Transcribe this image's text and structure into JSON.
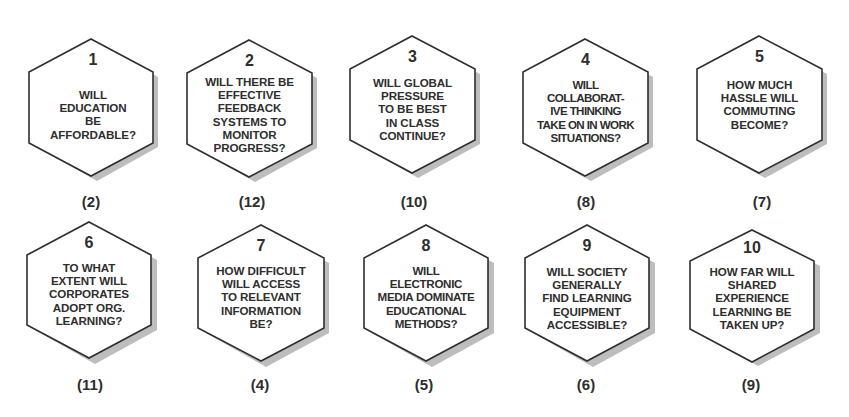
{
  "diagram": {
    "type": "hexagon-question-grid",
    "rows": 2,
    "columns": 5,
    "colors": {
      "outline": "#2e2e2e",
      "fill": "#ffffff",
      "shadow": "#bdbdbd",
      "text": "#2e2e2e"
    },
    "items": [
      {
        "number": "1",
        "question": "WILL\nEDUCATION\nBE\nAFFORDABLE?",
        "rank": "(2)"
      },
      {
        "number": "2",
        "question": "WILL THERE BE\nEFFECTIVE\nFEEDBACK\nSYSTEMS TO\nMONITOR\nPROGRESS?",
        "rank": "(12)"
      },
      {
        "number": "3",
        "question": "WILL GLOBAL\nPRESSURE\nTO BE BEST\nIN CLASS\nCONTINUE?",
        "rank": "(10)"
      },
      {
        "number": "4",
        "question": "WILL\nCOLLABORAT-\nIVE THINKING\nTAKE ON IN WORK\nSITUATIONS?",
        "rank": "(8)"
      },
      {
        "number": "5",
        "question": "HOW MUCH\nHASSLE WILL\nCOMMUTING\nBECOME?",
        "rank": "(7)"
      },
      {
        "number": "6",
        "question": "TO WHAT\nEXTENT WILL\nCORPORATES\nADOPT ORG.\nLEARNING?",
        "rank": "(11)"
      },
      {
        "number": "7",
        "question": "HOW DIFFICULT\nWILL ACCESS\nTO RELEVANT\nINFORMATION\nBE?",
        "rank": "(4)"
      },
      {
        "number": "8",
        "question": "WILL\nELECTRONIC\nMEDIA DOMINATE\nEDUCATIONAL\nMETHODS?",
        "rank": "(5)"
      },
      {
        "number": "9",
        "question": "WILL SOCIETY\nGENERALLY\nFIND LEARNING\nEQUIPMENT\nACCESSIBLE?",
        "rank": "(6)"
      },
      {
        "number": "10",
        "question": "HOW FAR WILL\nSHARED\nEXPERIENCE\nLEARNING BE\nTAKEN UP?",
        "rank": "(9)"
      }
    ]
  }
}
